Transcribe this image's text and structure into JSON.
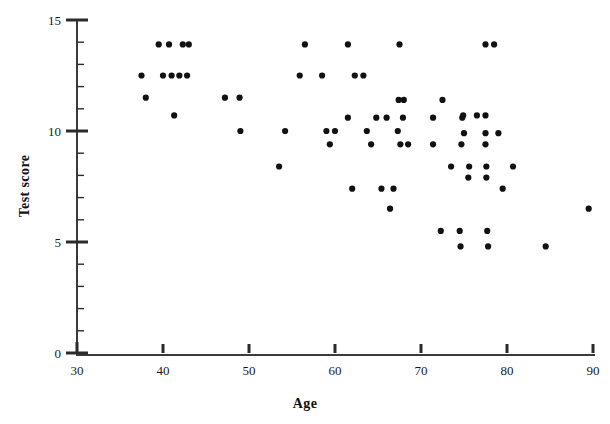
{
  "chart_data": {
    "type": "scatter",
    "title": "",
    "xlabel": "Age",
    "ylabel": "Test score",
    "xlim": [
      30,
      90
    ],
    "ylim": [
      0,
      15
    ],
    "xticks": [
      30,
      40,
      50,
      60,
      70,
      80,
      90
    ],
    "yticks": [
      0,
      5,
      10,
      15
    ],
    "x_minor_tick_step": 2,
    "y_minor_tick_step": 1,
    "grid": false,
    "legend": null,
    "marker": {
      "shape": "circle",
      "color": "#111111",
      "size_px": 5
    },
    "axis_color": "#333333",
    "background": "#ffffff",
    "n_points": 69,
    "points": [
      {
        "x": 37.5,
        "y": 12.5
      },
      {
        "x": 38.0,
        "y": 11.5
      },
      {
        "x": 39.5,
        "y": 13.9
      },
      {
        "x": 40.0,
        "y": 12.5
      },
      {
        "x": 40.7,
        "y": 13.9
      },
      {
        "x": 41.0,
        "y": 12.5
      },
      {
        "x": 41.3,
        "y": 10.7
      },
      {
        "x": 41.9,
        "y": 12.5
      },
      {
        "x": 42.3,
        "y": 13.9
      },
      {
        "x": 42.8,
        "y": 12.5
      },
      {
        "x": 43.0,
        "y": 13.9
      },
      {
        "x": 47.2,
        "y": 11.5
      },
      {
        "x": 48.9,
        "y": 11.5
      },
      {
        "x": 49.0,
        "y": 10.0
      },
      {
        "x": 53.5,
        "y": 8.4
      },
      {
        "x": 54.2,
        "y": 10.0
      },
      {
        "x": 55.9,
        "y": 12.5
      },
      {
        "x": 56.5,
        "y": 13.9
      },
      {
        "x": 58.5,
        "y": 12.5
      },
      {
        "x": 59.0,
        "y": 10.0
      },
      {
        "x": 59.4,
        "y": 9.4
      },
      {
        "x": 60.0,
        "y": 10.0
      },
      {
        "x": 61.5,
        "y": 13.9
      },
      {
        "x": 61.5,
        "y": 10.6
      },
      {
        "x": 62.0,
        "y": 7.4
      },
      {
        "x": 62.3,
        "y": 12.5
      },
      {
        "x": 63.3,
        "y": 12.5
      },
      {
        "x": 63.7,
        "y": 10.0
      },
      {
        "x": 64.2,
        "y": 9.4
      },
      {
        "x": 64.8,
        "y": 10.6
      },
      {
        "x": 65.4,
        "y": 7.4
      },
      {
        "x": 66.0,
        "y": 10.6
      },
      {
        "x": 66.4,
        "y": 6.5
      },
      {
        "x": 66.8,
        "y": 7.4
      },
      {
        "x": 67.3,
        "y": 10.0
      },
      {
        "x": 67.4,
        "y": 11.4
      },
      {
        "x": 67.5,
        "y": 13.9
      },
      {
        "x": 67.6,
        "y": 9.4
      },
      {
        "x": 67.9,
        "y": 10.6
      },
      {
        "x": 68.0,
        "y": 11.4
      },
      {
        "x": 71.4,
        "y": 10.6
      },
      {
        "x": 71.4,
        "y": 9.4
      },
      {
        "x": 72.3,
        "y": 5.5
      },
      {
        "x": 72.5,
        "y": 11.4
      },
      {
        "x": 73.5,
        "y": 8.4
      },
      {
        "x": 74.5,
        "y": 5.5
      },
      {
        "x": 74.6,
        "y": 4.8
      },
      {
        "x": 74.7,
        "y": 9.4
      },
      {
        "x": 74.8,
        "y": 10.6
      },
      {
        "x": 74.9,
        "y": 10.7
      },
      {
        "x": 75.5,
        "y": 7.9
      },
      {
        "x": 75.6,
        "y": 8.4
      },
      {
        "x": 76.5,
        "y": 10.7
      },
      {
        "x": 77.5,
        "y": 13.9
      },
      {
        "x": 77.5,
        "y": 10.7
      },
      {
        "x": 77.5,
        "y": 9.9
      },
      {
        "x": 77.5,
        "y": 9.4
      },
      {
        "x": 77.6,
        "y": 8.4
      },
      {
        "x": 77.6,
        "y": 7.9
      },
      {
        "x": 77.7,
        "y": 5.5
      },
      {
        "x": 77.8,
        "y": 4.8
      },
      {
        "x": 78.5,
        "y": 13.9
      },
      {
        "x": 79.0,
        "y": 9.9
      },
      {
        "x": 79.5,
        "y": 7.4
      },
      {
        "x": 80.7,
        "y": 8.4
      },
      {
        "x": 84.5,
        "y": 4.8
      },
      {
        "x": 89.5,
        "y": 6.5
      },
      {
        "x": 75.0,
        "y": 9.9
      },
      {
        "x": 68.5,
        "y": 9.4
      }
    ]
  },
  "axes": {
    "x_axis_label": "Age",
    "y_axis_label": "Test score",
    "x_tick_labels": [
      "30",
      "40",
      "50",
      "60",
      "70",
      "80",
      "90"
    ],
    "y_tick_labels": [
      "0",
      "5",
      "10",
      "15"
    ]
  }
}
